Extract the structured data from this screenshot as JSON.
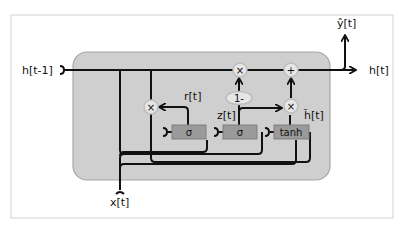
{
  "diagram": {
    "colors": {
      "frame": "#d9d9d9",
      "cell_fill": "#cfcfcf",
      "cell_stroke": "#a8a8a8",
      "gate_fill": "#9a9a9a",
      "op_fill": "#e6e6e6",
      "wire": "#111111"
    },
    "inputs": {
      "h_prev": "h[t-1]",
      "x": "x[t]"
    },
    "outputs": {
      "h": "h[t]",
      "y_hat": "ŷ[t]"
    },
    "gates": {
      "reset": {
        "label": "σ",
        "signal": "r[t]"
      },
      "update": {
        "label": "σ",
        "signal": "z[t]"
      },
      "candidate": {
        "label": "tanh",
        "signal": "h̃[t]"
      }
    },
    "ops": {
      "reset_mul": "×",
      "keep_mul": "×",
      "cand_mul": "×",
      "add": "+",
      "one_minus": "1-"
    }
  }
}
